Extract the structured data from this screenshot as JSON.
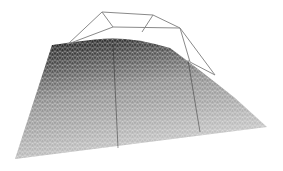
{
  "figure": {
    "background_color": "#ffffff",
    "mesh": {
      "outline": [
        [
          52,
          45
        ],
        [
          80,
          41
        ],
        [
          110,
          38
        ],
        [
          140,
          40
        ],
        [
          170,
          48
        ],
        [
          200,
          70
        ],
        [
          235,
          98
        ],
        [
          267,
          127
        ],
        [
          15,
          159
        ]
      ],
      "top_silhouette": [
        [
          52,
          45
        ],
        [
          80,
          41
        ],
        [
          110,
          38
        ],
        [
          140,
          40
        ],
        [
          170,
          48
        ]
      ],
      "right_edge": [
        [
          170,
          48
        ],
        [
          200,
          70
        ],
        [
          235,
          98
        ],
        [
          267,
          127
        ]
      ],
      "bottom_edge": [
        [
          15,
          159
        ],
        [
          267,
          127
        ]
      ],
      "left_edge": [
        [
          52,
          45
        ],
        [
          15,
          159
        ]
      ],
      "dark_color": "#1a1a1a",
      "light_color": "#d8d8d8",
      "wire_color": "#555555",
      "seams": [
        [
          [
            113,
            44
          ],
          [
            118,
            148
          ]
        ],
        [
          [
            188,
            60
          ],
          [
            200,
            132
          ]
        ]
      ]
    },
    "control_cage": {
      "color": "#8a8a8a",
      "vertices": {
        "a": [
          102,
          12
        ],
        "b": [
          153,
          15
        ],
        "c": [
          180,
          28
        ],
        "d": [
          113,
          27
        ],
        "e": [
          68,
          44
        ],
        "f": [
          142,
          32
        ],
        "g": [
          190,
          62
        ],
        "h": [
          215,
          75
        ]
      },
      "edges": [
        [
          "a",
          "b"
        ],
        [
          "b",
          "c"
        ],
        [
          "a",
          "d"
        ],
        [
          "d",
          "c"
        ],
        [
          "a",
          "e"
        ],
        [
          "b",
          "f"
        ],
        [
          "c",
          "g"
        ],
        [
          "g",
          "h"
        ],
        [
          "d",
          "e"
        ],
        [
          "c",
          "h"
        ]
      ]
    }
  }
}
